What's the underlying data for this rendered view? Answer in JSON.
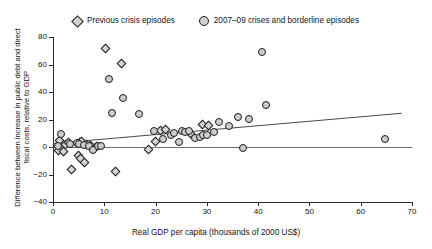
{
  "legend": {
    "entries": [
      {
        "label": "Previous crisis episodes",
        "marker": "diamond-marker-icon"
      },
      {
        "label": "2007–09 crises and borderline episodes",
        "marker": "circle-marker-icon"
      }
    ]
  },
  "chart_data": {
    "type": "scatter",
    "title": "",
    "xlabel": "Real GDP per capita (thousands of 2000 US$)",
    "ylabel": "Difference between increase in public debt and direct fiscal costs, relative to GDP",
    "xlim": [
      0,
      70
    ],
    "ylim": [
      -40,
      80
    ],
    "xticks": [
      0,
      10,
      20,
      30,
      40,
      50,
      60,
      70
    ],
    "yticks": [
      -40,
      -20,
      0,
      20,
      40,
      60,
      80
    ],
    "grid": false,
    "legend_position": "top-center",
    "reference_lines": [
      {
        "name": "zero-line",
        "type": "horizontal",
        "y": 0
      },
      {
        "name": "trend-line",
        "type": "linear",
        "x0": 0,
        "y0": 3,
        "x1": 68,
        "y1": 25
      }
    ],
    "series": [
      {
        "name": "Previous crisis episodes",
        "marker": "diamond",
        "points": [
          [
            10.2,
            71.5
          ],
          [
            13.4,
            60.5
          ],
          [
            1.2,
            5.0
          ],
          [
            2.4,
            1.5
          ],
          [
            3.0,
            3.5
          ],
          [
            5.2,
            3.5
          ],
          [
            5.6,
            4.2
          ],
          [
            6.6,
            1.5
          ],
          [
            7.4,
            1.0
          ],
          [
            8.4,
            0.5
          ],
          [
            1.0,
            -2.5
          ],
          [
            2.0,
            -3.0
          ],
          [
            5.0,
            -6.0
          ],
          [
            5.4,
            -8.0
          ],
          [
            6.2,
            -11.0
          ],
          [
            3.6,
            -16.5
          ],
          [
            12.2,
            -18.0
          ],
          [
            20.0,
            4.0
          ],
          [
            21.0,
            12.0
          ],
          [
            22.0,
            12.5
          ],
          [
            26.8,
            9.5
          ],
          [
            29.2,
            16.5
          ],
          [
            30.4,
            16.0
          ],
          [
            18.6,
            -2.0
          ]
        ]
      },
      {
        "name": "2007–09 crises and borderline episodes",
        "marker": "circle",
        "points": [
          [
            11.0,
            49.5
          ],
          [
            40.8,
            69.0
          ],
          [
            13.6,
            36.0
          ],
          [
            1.6,
            9.5
          ],
          [
            3.4,
            2.0
          ],
          [
            1.0,
            0.5
          ],
          [
            4.6,
            3.0
          ],
          [
            5.0,
            2.5
          ],
          [
            6.0,
            1.5
          ],
          [
            7.0,
            0.5
          ],
          [
            7.8,
            -2.0
          ],
          [
            8.8,
            1.0
          ],
          [
            9.4,
            0.5
          ],
          [
            11.6,
            24.5
          ],
          [
            16.8,
            24.0
          ],
          [
            19.6,
            12.0
          ],
          [
            21.4,
            6.0
          ],
          [
            23.0,
            8.5
          ],
          [
            24.6,
            3.5
          ],
          [
            25.2,
            11.5
          ],
          [
            25.8,
            11.0
          ],
          [
            26.6,
            11.5
          ],
          [
            27.6,
            6.5
          ],
          [
            28.6,
            7.0
          ],
          [
            29.2,
            9.0
          ],
          [
            30.0,
            9.0
          ],
          [
            31.4,
            11.0
          ],
          [
            32.4,
            18.0
          ],
          [
            34.4,
            15.0
          ],
          [
            36.0,
            22.0
          ],
          [
            38.2,
            20.5
          ],
          [
            41.6,
            30.5
          ],
          [
            37.0,
            -1.0
          ],
          [
            64.8,
            6.0
          ],
          [
            23.6,
            10.0
          ]
        ]
      }
    ]
  }
}
